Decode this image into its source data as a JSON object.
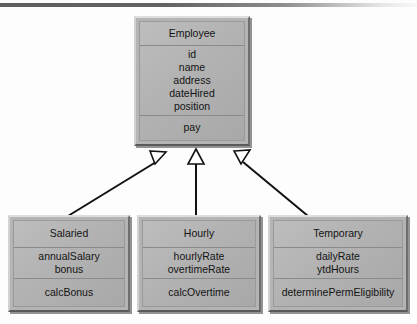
{
  "diagram": {
    "type": "uml-class-diagram",
    "relationship": "generalization",
    "colors": {
      "box_fill": "#b4b4b4",
      "box_light_bevel": "#dedede",
      "box_dark_bevel": "#5a5a5a",
      "line": "#111111",
      "text": "#141414",
      "background": "#fdfdfd",
      "top_rule": "#5f5f5f"
    },
    "classes": [
      {
        "id": "employee",
        "name": "Employee",
        "attributes": [
          "id",
          "name",
          "address",
          "dateHired",
          "position"
        ],
        "operations": [
          "pay"
        ]
      },
      {
        "id": "salaried",
        "name": "Salaried",
        "attributes": [
          "annualSalary",
          "bonus"
        ],
        "operations": [
          "calcBonus"
        ]
      },
      {
        "id": "hourly",
        "name": "Hourly",
        "attributes": [
          "hourlyRate",
          "overtimeRate"
        ],
        "operations": [
          "calcOvertime"
        ]
      },
      {
        "id": "temporary",
        "name": "Temporary",
        "attributes": [
          "dailyRate",
          "ytdHours"
        ],
        "operations": [
          "determinePermEligibility"
        ]
      }
    ],
    "generalizations": [
      {
        "from": "salaried",
        "to": "employee"
      },
      {
        "from": "hourly",
        "to": "employee"
      },
      {
        "from": "temporary",
        "to": "employee"
      }
    ]
  }
}
